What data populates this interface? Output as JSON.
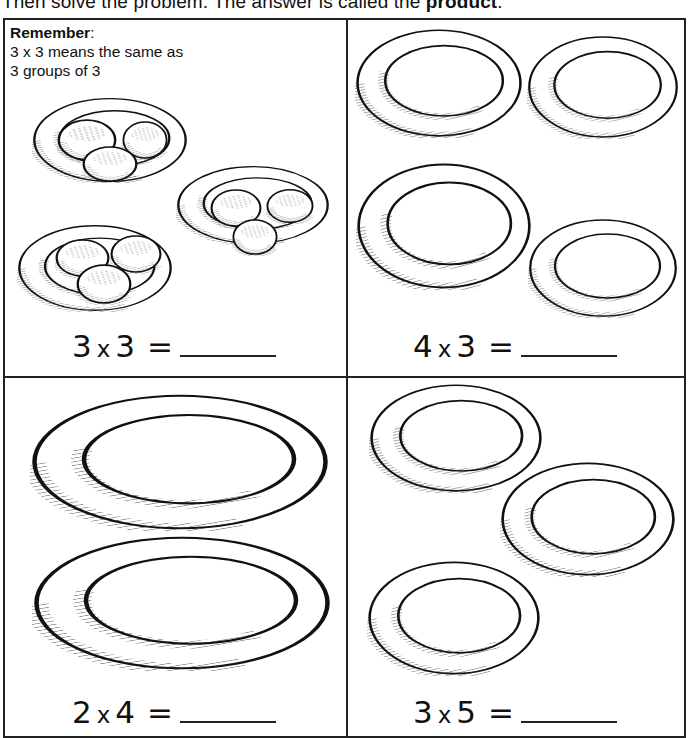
{
  "instruction": {
    "text_prefix": "Then solve the problem. The answer is called the ",
    "bold_word": "product",
    "suffix": "."
  },
  "remember": {
    "title": "Remember",
    "colon": ":",
    "line1": "3 x 3 means the same as",
    "line2": "3 groups of 3"
  },
  "problems": [
    {
      "a": "3",
      "op": "x",
      "b": "3",
      "eq": "=",
      "answer": "",
      "groups": 3,
      "items_per_group": 3,
      "illustration": "plates-with-cookies"
    },
    {
      "a": "4",
      "op": "x",
      "b": "3",
      "eq": "=",
      "answer": "",
      "groups": 4,
      "illustration": "empty-plates"
    },
    {
      "a": "2",
      "op": "x",
      "b": "4",
      "eq": "=",
      "answer": "",
      "groups": 2,
      "illustration": "empty-plates"
    },
    {
      "a": "3",
      "op": "x",
      "b": "5",
      "eq": "=",
      "answer": "",
      "groups": 3,
      "illustration": "empty-plates"
    }
  ],
  "colors": {
    "ink": "#111111",
    "paper": "#ffffff"
  }
}
